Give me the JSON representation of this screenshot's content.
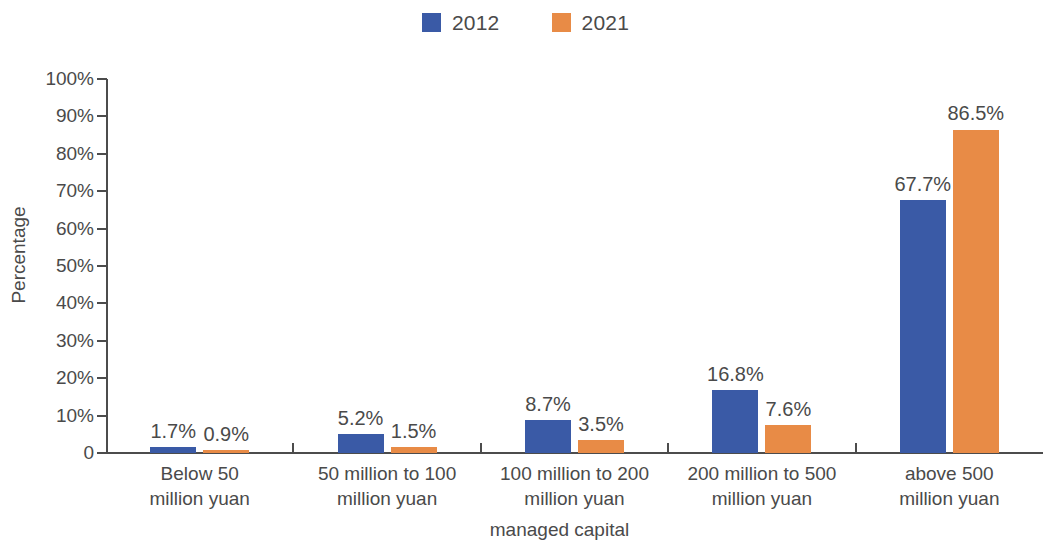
{
  "chart_data": {
    "type": "bar",
    "title": "",
    "xlabel": "managed capital",
    "ylabel": "Percentage",
    "ylim": [
      0,
      100
    ],
    "ytick_labels": [
      "100%",
      "90%",
      "80%",
      "70%",
      "60%",
      "50%",
      "40%",
      "30%",
      "20%",
      "10%",
      "0"
    ],
    "ytick_values": [
      100,
      90,
      80,
      70,
      60,
      50,
      40,
      30,
      20,
      10,
      0
    ],
    "grid": false,
    "legend_position": "top-center",
    "categories": [
      {
        "line1": "Below 50",
        "line2": "million yuan"
      },
      {
        "line1": "50 million to 100",
        "line2": "million yuan"
      },
      {
        "line1": "100 million to 200",
        "line2": "million yuan"
      },
      {
        "line1": "200 million to 500",
        "line2": "million yuan"
      },
      {
        "line1": "above 500",
        "line2": "million yuan"
      }
    ],
    "series": [
      {
        "name": "2012",
        "color": "#3a5aa6",
        "values": [
          1.7,
          5.2,
          8.7,
          16.8,
          67.7
        ],
        "labels": [
          "1.7%",
          "5.2%",
          "8.7%",
          "16.8%",
          "67.7%"
        ]
      },
      {
        "name": "2021",
        "color": "#e88b46",
        "values": [
          0.9,
          1.5,
          3.5,
          7.6,
          86.5
        ],
        "labels": [
          "0.9%",
          "1.5%",
          "3.5%",
          "7.6%",
          "86.5%"
        ]
      }
    ]
  },
  "legend": {
    "entries": [
      {
        "label": "2012",
        "color": "#3a5aa6"
      },
      {
        "label": "2021",
        "color": "#e88b46"
      }
    ]
  },
  "axes": {
    "y_title": "Percentage",
    "x_title": "managed capital"
  }
}
